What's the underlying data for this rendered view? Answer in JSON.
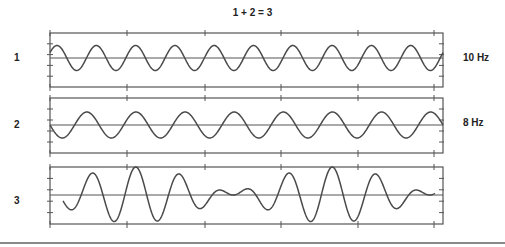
{
  "title": "1 + 2 = 3",
  "panels": [
    {
      "label": "1",
      "freq_label": "10 Hz"
    },
    {
      "label": "2",
      "freq_label": "8 Hz"
    },
    {
      "label": "3",
      "freq_label": ""
    }
  ],
  "colors": {
    "stroke": "#4a4a4a",
    "axis": "#555555",
    "rule": "#8a8a8a"
  },
  "chart_data": {
    "type": "line",
    "title": "1 + 2 = 3",
    "xlabel": "",
    "ylabel": "",
    "grid": false,
    "duration_s": 1.0,
    "series": [
      {
        "name": "1",
        "frequency_hz": 10,
        "amplitude": 1.0,
        "description": "sine wave, 10 cycles"
      },
      {
        "name": "2",
        "frequency_hz": 8,
        "amplitude": 1.0,
        "description": "sine wave, 8 cycles"
      },
      {
        "name": "3",
        "description": "sum of 1 and 2 (beat pattern, 2 Hz envelope)",
        "components_hz": [
          10,
          8
        ]
      }
    ],
    "annotations": [
      "10 Hz",
      "8 Hz"
    ]
  }
}
